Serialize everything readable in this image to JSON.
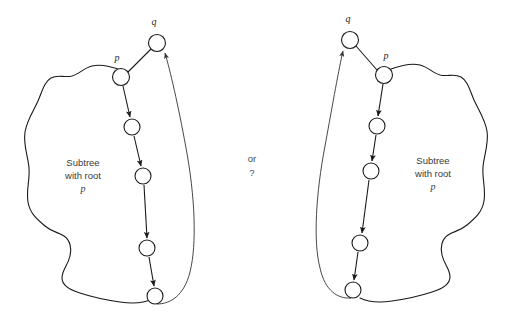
{
  "figure": {
    "background_color": "#ffffff",
    "stroke_color": "#1a1a1a",
    "text_color": "#3a3a3a",
    "width": 505,
    "height": 328
  },
  "middle": {
    "or_label": "or",
    "question_label": "?"
  },
  "left_diagram": {
    "name": "left-alternative",
    "node_q_label": "q",
    "node_p_label": "p",
    "caption_line1": "Subtree",
    "caption_line2": "with root",
    "caption_line3": "p",
    "nodes": [
      {
        "id": "q",
        "cx": 157,
        "cy": 43,
        "r": 8.5,
        "label": "q"
      },
      {
        "id": "p",
        "cx": 121,
        "cy": 77,
        "r": 8.5,
        "label": "p"
      },
      {
        "id": "n1",
        "cx": 132,
        "cy": 127,
        "r": 8.0,
        "label": ""
      },
      {
        "id": "n2",
        "cx": 143,
        "cy": 176,
        "r": 8.0,
        "label": ""
      },
      {
        "id": "n3",
        "cx": 147,
        "cy": 248,
        "r": 8.0,
        "label": ""
      },
      {
        "id": "n4",
        "cx": 155,
        "cy": 296,
        "r": 8.0,
        "label": ""
      }
    ],
    "edges": [
      {
        "from": "p",
        "to": "q",
        "arrow": false
      },
      {
        "from": "p",
        "to": "n1",
        "arrow": true
      },
      {
        "from": "n1",
        "to": "n2",
        "arrow": true
      },
      {
        "from": "n2",
        "to": "n3",
        "arrow": true
      },
      {
        "from": "n3",
        "to": "n4",
        "arrow": true
      },
      {
        "from": "n4",
        "to": "q",
        "arrow": true,
        "curved": true
      }
    ]
  },
  "right_diagram": {
    "name": "right-alternative",
    "node_q_label": "q",
    "node_p_label": "p",
    "caption_line1": "Subtree",
    "caption_line2": "with root",
    "caption_line3": "p",
    "nodes": [
      {
        "id": "q",
        "cx": 350,
        "cy": 40,
        "r": 8.5,
        "label": "q"
      },
      {
        "id": "p",
        "cx": 384,
        "cy": 75,
        "r": 8.5,
        "label": "p"
      },
      {
        "id": "n1",
        "cx": 377,
        "cy": 126,
        "r": 8.0,
        "label": ""
      },
      {
        "id": "n2",
        "cx": 371,
        "cy": 171,
        "r": 8.0,
        "label": ""
      },
      {
        "id": "n3",
        "cx": 360,
        "cy": 243,
        "r": 8.0,
        "label": ""
      },
      {
        "id": "n4",
        "cx": 353,
        "cy": 290,
        "r": 8.0,
        "label": ""
      }
    ],
    "edges": [
      {
        "from": "p",
        "to": "q",
        "arrow": false
      },
      {
        "from": "p",
        "to": "n1",
        "arrow": true
      },
      {
        "from": "n1",
        "to": "n2",
        "arrow": true
      },
      {
        "from": "n2",
        "to": "n3",
        "arrow": true
      },
      {
        "from": "n3",
        "to": "n4",
        "arrow": true
      },
      {
        "from": "n4",
        "to": "q",
        "arrow": true,
        "curved": true
      }
    ]
  }
}
